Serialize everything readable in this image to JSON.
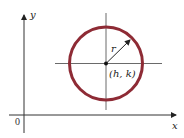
{
  "diagram": {
    "labels": {
      "y_axis": "y",
      "x_axis": "x",
      "origin": "0",
      "radius": "r",
      "center": "(h, k)"
    },
    "colors": {
      "circle": "#8e2b35",
      "axes": "#333333",
      "lines": "#444444"
    },
    "geometry": {
      "center_px": [
        106,
        63.5
      ],
      "radius_px": 36.5,
      "y_axis_x": 24,
      "x_axis_y": 115
    }
  }
}
